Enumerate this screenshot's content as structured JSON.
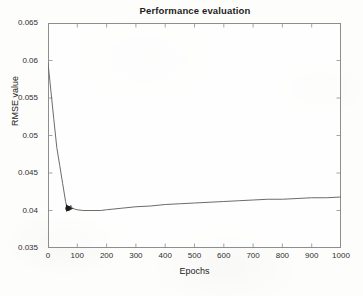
{
  "chart_data": {
    "type": "line",
    "title": "Performance evaluation",
    "xlabel": "Epochs",
    "ylabel": "RMSE value",
    "xlim": [
      0,
      1000
    ],
    "ylim": [
      0.035,
      0.065
    ],
    "xticks": [
      0,
      100,
      200,
      300,
      400,
      500,
      600,
      700,
      800,
      900,
      1000
    ],
    "xtick_labels": [
      "0",
      "100",
      "200",
      "300",
      "400",
      "500",
      "600",
      "700",
      "800",
      "900",
      "1000"
    ],
    "yticks": [
      0.035,
      0.04,
      0.045,
      0.05,
      0.055,
      0.06,
      0.065
    ],
    "ytick_labels": [
      "0.035",
      "0.04",
      "0.045",
      "0.05",
      "0.055",
      "0.06",
      "0.065"
    ],
    "grid": false,
    "legend": "none",
    "line_color": "#6b6b6b",
    "marker_color": "#1a1a1a",
    "series": [
      {
        "name": "RMSE",
        "x": [
          0,
          10,
          20,
          30,
          40,
          50,
          60,
          65,
          70,
          72,
          75,
          78,
          80,
          85,
          90,
          100,
          120,
          140,
          160,
          180,
          200,
          250,
          300,
          350,
          400,
          450,
          500,
          550,
          600,
          650,
          700,
          750,
          800,
          850,
          900,
          950,
          1000
        ],
        "y": [
          0.0597,
          0.0559,
          0.0521,
          0.0484,
          0.046,
          0.0436,
          0.0412,
          0.0404,
          0.0401,
          0.0406,
          0.0403,
          0.0407,
          0.0404,
          0.0403,
          0.0402,
          0.0401,
          0.04,
          0.04,
          0.04,
          0.04,
          0.0401,
          0.0403,
          0.0405,
          0.0406,
          0.0408,
          0.0409,
          0.041,
          0.0411,
          0.0412,
          0.0413,
          0.0414,
          0.0415,
          0.0415,
          0.0416,
          0.0417,
          0.0417,
          0.0418
        ]
      }
    ],
    "annotations": [
      {
        "name": "minimum-marker",
        "x": 72,
        "y": 0.0403,
        "shape": "filled-marker"
      }
    ]
  }
}
